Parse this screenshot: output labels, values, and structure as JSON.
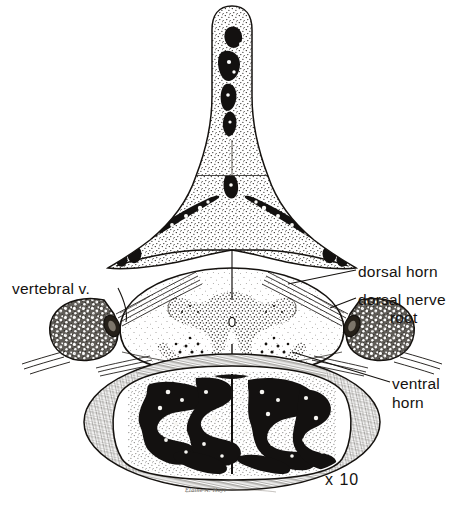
{
  "figure": {
    "magnification": "x 10",
    "signature": "Elaine A. Hoyt",
    "background_color": "#ffffff",
    "ink_color": "#15120f",
    "medium": "pen-and-ink stipple drawing"
  },
  "labels": {
    "vertebral_vein": "vertebral v.",
    "dorsal_horn": "dorsal horn",
    "dorsal_nerve_root_line1": "dorsal nerve",
    "dorsal_nerve_root_line2": "root",
    "ventral_horn_line1": "ventral",
    "ventral_horn_line2": "horn"
  },
  "structures": [
    {
      "name": "spinous-process",
      "description": "superior midline bony projection with stippled cortical bone and dark marrow cavities"
    },
    {
      "name": "vertebral-lamina-left",
      "description": "left lamina with elongated dark marrow space"
    },
    {
      "name": "vertebral-lamina-right",
      "description": "right lamina with elongated dark marrow space"
    },
    {
      "name": "spinal-cord",
      "description": "oval cord occupying the vertebral canal with butterfly-shaped gray matter"
    },
    {
      "name": "gray-matter-butterfly",
      "description": "H-shaped stippled gray matter with dorsal and ventral horns"
    },
    {
      "name": "central-canal",
      "description": "tiny oval at center of the cord"
    },
    {
      "name": "dorsal-nerve-root-left",
      "description": "fiber bundle leaving cord dorsolaterally to the left"
    },
    {
      "name": "dorsal-nerve-root-right",
      "description": "fiber bundle leaving cord dorsolaterally to the right"
    },
    {
      "name": "transverse-process-left",
      "description": "left wing of bone with cellular trabecular texture"
    },
    {
      "name": "transverse-process-right",
      "description": "right wing of bone with cellular trabecular texture"
    },
    {
      "name": "vertebral-vein-left",
      "description": "small dark oval vessel in the left transverse foramen"
    },
    {
      "name": "vertebral-vein-right",
      "description": "small dark oval vessel in the right transverse foramen"
    },
    {
      "name": "vertebral-body",
      "description": "large inferior body filled with dense dark trabecular bone surrounded by cortical rim"
    }
  ]
}
